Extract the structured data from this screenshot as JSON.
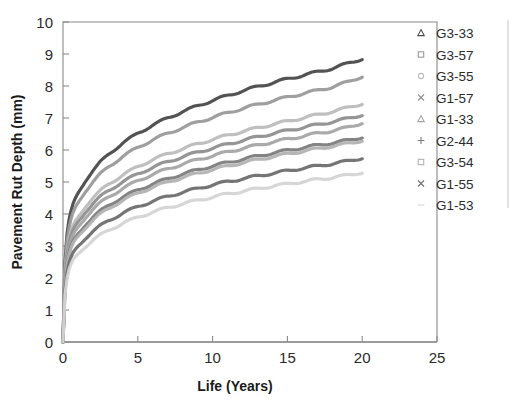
{
  "chart_data": {
    "type": "line",
    "title": "",
    "xlabel": "Life (Years)",
    "ylabel": "Pavement Rut Depth (mm)",
    "xlim": [
      0,
      25
    ],
    "ylim": [
      0,
      10
    ],
    "xticks": [
      0,
      5,
      10,
      15,
      20,
      25
    ],
    "yticks": [
      0,
      1,
      2,
      3,
      4,
      5,
      6,
      7,
      8,
      9,
      10
    ],
    "grid": false,
    "legend_position": "top-right",
    "x": [
      0,
      0.05,
      0.1,
      0.2,
      0.35,
      0.5,
      0.75,
      1,
      1.5,
      2,
      2.5,
      3,
      4,
      5,
      6,
      7,
      8,
      9,
      10,
      11,
      12,
      13,
      14,
      15,
      16,
      17,
      18,
      19,
      20
    ],
    "series": [
      {
        "name": "G3-33",
        "marker": "triangle",
        "color": "#4a4a4a",
        "values": [
          0,
          1.3,
          2.2,
          3.1,
          3.7,
          4.05,
          4.4,
          4.65,
          5.05,
          5.35,
          5.62,
          5.85,
          6.22,
          6.52,
          6.78,
          7.0,
          7.2,
          7.38,
          7.55,
          7.7,
          7.85,
          7.98,
          8.1,
          8.22,
          8.33,
          8.44,
          8.55,
          8.7,
          8.85
        ]
      },
      {
        "name": "G3-57",
        "marker": "square",
        "color": "#9a9a9a",
        "values": [
          0,
          1.2,
          2.05,
          2.9,
          3.45,
          3.8,
          4.12,
          4.35,
          4.72,
          5.0,
          5.25,
          5.46,
          5.8,
          6.08,
          6.32,
          6.52,
          6.7,
          6.87,
          7.02,
          7.16,
          7.3,
          7.42,
          7.54,
          7.65,
          7.76,
          7.86,
          7.97,
          8.12,
          8.3
        ]
      },
      {
        "name": "G3-55",
        "marker": "circle",
        "color": "#bcbcbc",
        "values": [
          0,
          1.1,
          1.88,
          2.62,
          3.12,
          3.42,
          3.7,
          3.9,
          4.24,
          4.5,
          4.72,
          4.92,
          5.22,
          5.48,
          5.7,
          5.88,
          6.04,
          6.19,
          6.33,
          6.46,
          6.58,
          6.69,
          6.8,
          6.9,
          7.0,
          7.1,
          7.2,
          7.32,
          7.45
        ]
      },
      {
        "name": "G1-57",
        "marker": "cross",
        "color": "#8f8f8f",
        "values": [
          0,
          1.05,
          1.8,
          2.52,
          3.0,
          3.3,
          3.56,
          3.75,
          4.07,
          4.32,
          4.54,
          4.72,
          5.01,
          5.25,
          5.46,
          5.63,
          5.79,
          5.93,
          6.06,
          6.18,
          6.3,
          6.41,
          6.51,
          6.61,
          6.7,
          6.79,
          6.88,
          6.98,
          7.1
        ]
      },
      {
        "name": "G1-33",
        "marker": "triangle",
        "color": "#a5a5a5",
        "values": [
          0,
          1.0,
          1.72,
          2.4,
          2.86,
          3.15,
          3.4,
          3.59,
          3.9,
          4.14,
          4.35,
          4.52,
          4.8,
          5.04,
          5.24,
          5.41,
          5.56,
          5.7,
          5.82,
          5.94,
          6.05,
          6.15,
          6.25,
          6.34,
          6.43,
          6.52,
          6.6,
          6.7,
          6.85
        ]
      },
      {
        "name": "G2-44",
        "marker": "plus",
        "color": "#7d7d7d",
        "values": [
          0,
          0.95,
          1.62,
          2.26,
          2.7,
          2.97,
          3.2,
          3.38,
          3.67,
          3.9,
          4.09,
          4.26,
          4.53,
          4.75,
          4.94,
          5.1,
          5.25,
          5.38,
          5.5,
          5.61,
          5.71,
          5.81,
          5.9,
          5.99,
          6.07,
          6.15,
          6.22,
          6.3,
          6.4
        ]
      },
      {
        "name": "G3-54",
        "marker": "square-open",
        "color": "#b2b2b2",
        "values": [
          0,
          0.92,
          1.58,
          2.2,
          2.63,
          2.9,
          3.13,
          3.3,
          3.58,
          3.81,
          4.0,
          4.16,
          4.43,
          4.65,
          4.84,
          5.0,
          5.14,
          5.27,
          5.39,
          5.5,
          5.6,
          5.7,
          5.79,
          5.88,
          5.96,
          6.04,
          6.12,
          6.2,
          6.3
        ]
      },
      {
        "name": "G1-55",
        "marker": "cross",
        "color": "#6e6e6e",
        "values": [
          0,
          0.82,
          1.42,
          1.98,
          2.37,
          2.62,
          2.83,
          2.99,
          3.25,
          3.46,
          3.63,
          3.78,
          4.03,
          4.23,
          4.4,
          4.55,
          4.68,
          4.8,
          4.91,
          5.01,
          5.1,
          5.19,
          5.27,
          5.35,
          5.43,
          5.5,
          5.57,
          5.65,
          5.75
        ]
      },
      {
        "name": "G1-53",
        "marker": "dash",
        "color": "#d4d4d4",
        "values": [
          0,
          0.75,
          1.3,
          1.82,
          2.18,
          2.41,
          2.6,
          2.75,
          2.99,
          3.18,
          3.34,
          3.48,
          3.71,
          3.9,
          4.06,
          4.2,
          4.32,
          4.43,
          4.53,
          4.63,
          4.71,
          4.79,
          4.87,
          4.94,
          5.01,
          5.08,
          5.14,
          5.21,
          5.3
        ]
      }
    ]
  },
  "axis": {
    "y_title": "Pavement Rut Depth (mm)",
    "x_title": "Life (Years)",
    "y_tick_labels": [
      "10",
      "9",
      "8",
      "7",
      "6",
      "5",
      "4",
      "3",
      "2",
      "1",
      "0"
    ],
    "x_tick_labels": [
      "0",
      "5",
      "10",
      "15",
      "20",
      "25"
    ]
  },
  "legend": {
    "entries": [
      {
        "label": "G3-33"
      },
      {
        "label": "G3-57"
      },
      {
        "label": "G3-55"
      },
      {
        "label": "G1-57"
      },
      {
        "label": "G1-33"
      },
      {
        "label": "G2-44"
      },
      {
        "label": "G3-54"
      },
      {
        "label": "G1-55"
      },
      {
        "label": "G1-53"
      }
    ]
  },
  "colors": {
    "axis": "#8a8a8a",
    "text": "#2b2b2b",
    "background": "#ffffff"
  }
}
